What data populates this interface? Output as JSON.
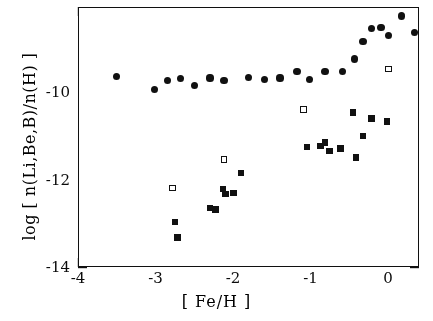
{
  "chart_data": {
    "type": "scatter",
    "title": "",
    "xlabel": "[ Fe/H ]",
    "ylabel": "log [ n(Li,Be,B)/n(H) ]",
    "xlim": [
      -4.0,
      0.39
    ],
    "ylim": [
      -14.0,
      -8.25
    ],
    "grid": false,
    "legend_position": "none",
    "xticks_major": [
      -4,
      -3,
      -2,
      -1,
      0
    ],
    "xticklabels": [
      "-4",
      "-3",
      "-2",
      "-1",
      "0"
    ],
    "xtick_minor_step": 0.2,
    "yticks_major": [
      -14,
      -12,
      -10
    ],
    "yticklabels": [
      "-14",
      "-12",
      "-10"
    ],
    "ytick_minor_step": 0.5,
    "series": [
      {
        "name": "Li (filled circles)",
        "marker": "filled-circle",
        "color": "#111111",
        "points": [
          [
            -3.5,
            -9.78
          ],
          [
            -3.02,
            -10.08
          ],
          [
            -2.85,
            -9.88
          ],
          [
            -2.68,
            -9.83
          ],
          [
            -2.5,
            -9.98
          ],
          [
            -2.3,
            -9.82
          ],
          [
            -2.12,
            -9.88
          ],
          [
            -1.8,
            -9.81
          ],
          [
            -1.6,
            -9.85
          ],
          [
            -1.4,
            -9.82
          ],
          [
            -1.18,
            -9.68
          ],
          [
            -1.02,
            -9.86
          ],
          [
            -0.82,
            -9.68
          ],
          [
            -0.6,
            -9.68
          ],
          [
            -0.44,
            -9.4
          ],
          [
            -0.33,
            -9.02
          ],
          [
            -0.22,
            -8.72
          ],
          [
            -0.1,
            -8.7
          ],
          [
            0.0,
            -8.88
          ],
          [
            0.17,
            -8.45
          ],
          [
            0.33,
            -8.82
          ]
        ]
      },
      {
        "name": "Be, B (filled squares)",
        "marker": "filled-square",
        "color": "#111111",
        "points": [
          [
            -2.75,
            -13.0
          ],
          [
            -2.72,
            -13.35
          ],
          [
            -2.3,
            -12.7
          ],
          [
            -2.23,
            -12.73
          ],
          [
            -2.13,
            -12.28
          ],
          [
            -2.1,
            -12.38
          ],
          [
            -2.0,
            -12.37
          ],
          [
            -1.9,
            -11.92
          ],
          [
            -1.05,
            -11.35
          ],
          [
            -0.88,
            -11.32
          ],
          [
            -0.82,
            -11.25
          ],
          [
            -0.76,
            -11.43
          ],
          [
            -0.62,
            -11.38
          ],
          [
            -0.46,
            -10.58
          ],
          [
            -0.42,
            -11.58
          ],
          [
            -0.33,
            -11.1
          ],
          [
            -0.22,
            -10.72
          ],
          [
            -0.02,
            -10.78
          ]
        ]
      },
      {
        "name": "upper limits (open squares)",
        "marker": "open-square",
        "color": "#111111",
        "points": [
          [
            -2.78,
            -12.25
          ],
          [
            -2.12,
            -11.62
          ],
          [
            -1.1,
            -10.52
          ],
          [
            0.0,
            -9.62
          ]
        ]
      }
    ]
  },
  "figure": {
    "xlabel": "[ Fe/H ]",
    "ylabel": "log [ n(Li,Be,B)/n(H) ]",
    "xticklabels": [
      "-4",
      "-3",
      "-2",
      "-1",
      "0"
    ],
    "yticklabels": [
      "-10",
      "-12",
      "-14"
    ]
  }
}
